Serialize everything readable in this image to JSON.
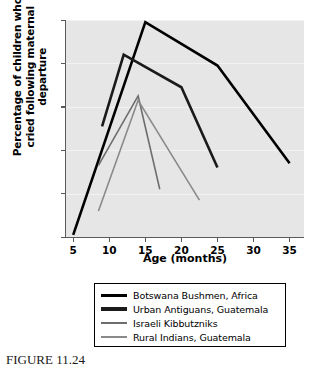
{
  "figure": {
    "caption": "FIGURE 11.24"
  },
  "chart_data": {
    "type": "line",
    "title": "",
    "xlabel": "Age (months)",
    "ylabel": "Percentage of children who cried following maternal departure",
    "ylabel_line1": "Percentage of children who",
    "ylabel_line2": "cried following maternal departure",
    "xlim": [
      4,
      37
    ],
    "ylim": [
      0,
      100
    ],
    "xticks": [
      5,
      10,
      15,
      20,
      25,
      30,
      35
    ],
    "yticks": [
      0,
      20,
      40,
      60,
      80,
      100
    ],
    "grid": true,
    "legend_position": "below",
    "series": [
      {
        "name": "Botswana Bushmen, Africa",
        "color": "#000000",
        "width": 2.6,
        "points": [
          [
            5,
            1
          ],
          [
            15,
            99
          ],
          [
            25,
            79
          ],
          [
            35,
            34
          ]
        ]
      },
      {
        "name": "Urban Antiguans, Guatemala",
        "color": "#1a1a1a",
        "width": 2.6,
        "points": [
          [
            9,
            51
          ],
          [
            12,
            84
          ],
          [
            20,
            69
          ],
          [
            25,
            32
          ]
        ]
      },
      {
        "name": "Israeli Kibbutzniks",
        "color": "#6e6e6e",
        "width": 1.6,
        "points": [
          [
            8.5,
            33
          ],
          [
            14,
            65
          ],
          [
            17,
            22
          ]
        ]
      },
      {
        "name": "Rural Indians, Guatemala",
        "color": "#8a8a8a",
        "width": 1.6,
        "points": [
          [
            8.5,
            12
          ],
          [
            14,
            63
          ],
          [
            22.5,
            17
          ]
        ]
      }
    ]
  },
  "legend": {
    "items": [
      {
        "label": "Botswana Bushmen, Africa",
        "color": "#000000",
        "thickness": 3
      },
      {
        "label": "Urban Antiguans, Guatemala",
        "color": "#1a1a1a",
        "thickness": 3.4
      },
      {
        "label": "Israeli Kibbutzniks",
        "color": "#6e6e6e",
        "thickness": 2
      },
      {
        "label": "Rural Indians, Guatemala",
        "color": "#8a8a8a",
        "thickness": 2
      }
    ]
  }
}
